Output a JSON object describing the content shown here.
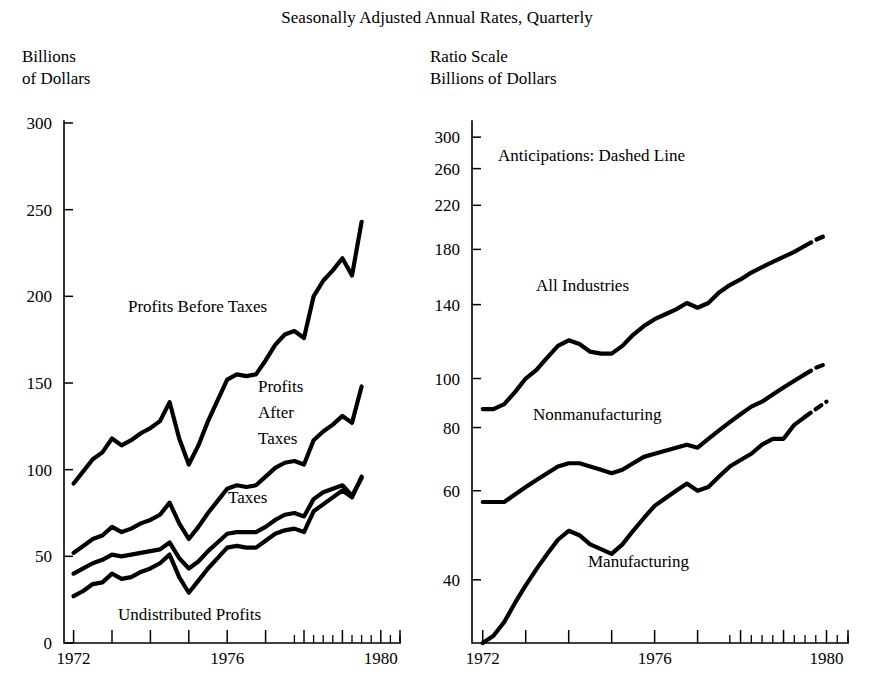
{
  "figure": {
    "title": "Seasonally Adjusted Annual Rates, Quarterly",
    "left_axis_caption": "Billions\nof Dollars",
    "right_axis_caption": "Ratio Scale\nBillions of Dollars"
  },
  "chart_data": [
    {
      "id": "left",
      "type": "line",
      "title": "Seasonally Adjusted Annual Rates, Quarterly",
      "ylabel": "Billions of Dollars",
      "xlabel": "",
      "scale": "linear",
      "grid": false,
      "legend": "inline-labels",
      "ylim": [
        0,
        300
      ],
      "xlim": [
        1971.75,
        1980.5
      ],
      "yticks": [
        0,
        50,
        100,
        150,
        200,
        250,
        300
      ],
      "ytick_labels": [
        "0",
        "50",
        "100",
        "150",
        "200",
        "250",
        "300"
      ],
      "xticks": [
        1972,
        1973,
        1974,
        1975,
        1976,
        1977,
        1978,
        1979,
        1980
      ],
      "xtick_labels": [
        "1972",
        "",
        "",
        "",
        "1976",
        "",
        "",
        "",
        "1980"
      ],
      "xtick_labels_shown": [
        "1972",
        "1976",
        "1980"
      ],
      "minor_xticks_note": "quarterly ticks shown from 1978 onward",
      "x": [
        1972.0,
        1972.25,
        1972.5,
        1972.75,
        1973.0,
        1973.25,
        1973.5,
        1973.75,
        1974.0,
        1974.25,
        1974.5,
        1974.75,
        1975.0,
        1975.25,
        1975.5,
        1975.75,
        1976.0,
        1976.25,
        1976.5,
        1976.75,
        1977.0,
        1977.25,
        1977.5,
        1977.75,
        1978.0,
        1978.25,
        1978.5,
        1978.75,
        1979.0,
        1979.25,
        1979.5
      ],
      "series": [
        {
          "name": "Profits Before Taxes",
          "label": "Profits Before Taxes",
          "style": "solid",
          "values": [
            92,
            99,
            106,
            110,
            118,
            114,
            117,
            121,
            124,
            128,
            139,
            118,
            103,
            114,
            128,
            140,
            152,
            155,
            154,
            155,
            163,
            172,
            178,
            180,
            176,
            200,
            209,
            215,
            222,
            212,
            243
          ]
        },
        {
          "name": "Profits After Taxes",
          "label": "Profits\nAfter\nTaxes",
          "style": "solid",
          "values": [
            52,
            56,
            60,
            62,
            67,
            64,
            66,
            69,
            71,
            74,
            81,
            69,
            60,
            67,
            75,
            82,
            89,
            91,
            90,
            91,
            96,
            101,
            104,
            105,
            103,
            117,
            122,
            126,
            131,
            127,
            148
          ]
        },
        {
          "name": "Taxes",
          "label": "Taxes",
          "style": "solid",
          "values": [
            40,
            43,
            46,
            48,
            51,
            50,
            51,
            52,
            53,
            54,
            58,
            49,
            43,
            47,
            53,
            58,
            63,
            64,
            64,
            64,
            67,
            71,
            74,
            75,
            73,
            83,
            87,
            89,
            91,
            85,
            95
          ]
        },
        {
          "name": "Undistributed Profits",
          "label": "Undistributed Profits",
          "style": "solid",
          "values": [
            27,
            30,
            34,
            35,
            40,
            37,
            38,
            41,
            43,
            46,
            51,
            38,
            29,
            36,
            43,
            49,
            55,
            56,
            55,
            55,
            59,
            63,
            65,
            66,
            64,
            76,
            80,
            84,
            88,
            84,
            96
          ]
        }
      ]
    },
    {
      "id": "right",
      "type": "line",
      "title": "Seasonally Adjusted Annual Rates, Quarterly",
      "ylabel": "Ratio Scale, Billions of Dollars",
      "xlabel": "",
      "scale": "log",
      "grid": false,
      "legend": "inline-labels",
      "annotation": "Anticipations:  Dashed Line",
      "ylim": [
        30,
        320
      ],
      "xlim": [
        1971.75,
        1980.5
      ],
      "yticks": [
        40,
        60,
        80,
        100,
        140,
        180,
        220,
        260,
        300
      ],
      "ytick_labels": [
        "40",
        "60",
        "80",
        "100",
        "140",
        "180",
        "220",
        "260",
        "300"
      ],
      "xticks": [
        1972,
        1973,
        1974,
        1975,
        1976,
        1977,
        1978,
        1979,
        1980
      ],
      "xtick_labels_shown": [
        "1972",
        "1976",
        "1980"
      ],
      "minor_xticks_note": "quarterly ticks shown from 1978 onward",
      "x": [
        1972.0,
        1972.25,
        1972.5,
        1972.75,
        1973.0,
        1973.25,
        1973.5,
        1973.75,
        1974.0,
        1974.25,
        1974.5,
        1974.75,
        1975.0,
        1975.25,
        1975.5,
        1975.75,
        1976.0,
        1976.25,
        1976.5,
        1976.75,
        1977.0,
        1977.25,
        1977.5,
        1977.75,
        1978.0,
        1978.25,
        1978.5,
        1978.75,
        1979.0,
        1979.25,
        1979.5,
        1979.75,
        1980.0
      ],
      "series": [
        {
          "name": "All Industries",
          "label": "All Industries",
          "style": "solid-with-dashed-tail",
          "dashed_from_index": 30,
          "values": [
            87,
            87,
            89,
            94,
            100,
            104,
            110,
            116,
            119,
            117,
            113,
            112,
            112,
            116,
            122,
            127,
            131,
            134,
            137,
            141,
            138,
            141,
            148,
            153,
            157,
            162,
            166,
            170,
            174,
            178,
            183,
            188,
            192
          ]
        },
        {
          "name": "Nonmanufacturing",
          "label": "Nonmanufacturing",
          "style": "solid-with-dashed-tail",
          "dashed_from_index": 30,
          "values": [
            57,
            57,
            57,
            59,
            61,
            63,
            65,
            67,
            68,
            68,
            67,
            66,
            65,
            66,
            68,
            70,
            71,
            72,
            73,
            74,
            73,
            76,
            79,
            82,
            85,
            88,
            90,
            93,
            96,
            99,
            102,
            105,
            107
          ]
        },
        {
          "name": "Manufacturing",
          "label": "Manufacturing",
          "style": "solid-with-dashed-tail",
          "dashed_from_index": 30,
          "values": [
            30,
            31,
            33,
            36,
            39,
            42,
            45,
            48,
            50,
            49,
            47,
            46,
            45,
            47,
            50,
            53,
            56,
            58,
            60,
            62,
            60,
            61,
            64,
            67,
            69,
            71,
            74,
            76,
            76,
            81,
            84,
            87,
            90
          ]
        }
      ]
    }
  ]
}
